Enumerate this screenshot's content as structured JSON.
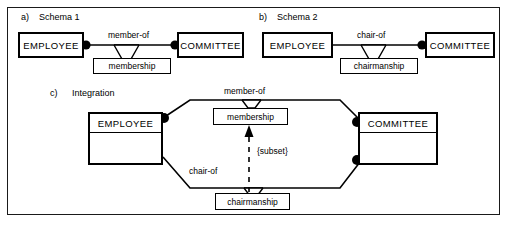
{
  "figure": {
    "border_color": "#1a1a1a",
    "background": "#ffffff",
    "ink_color": "#000000"
  },
  "parts": {
    "a": {
      "tag": "a)",
      "title": "Schema 1",
      "entity_left": "EMPLOYEE",
      "entity_right": "COMMITTEE",
      "relationship_label": "member-of",
      "relationship_box": "membership",
      "left_dot": true,
      "right_dot": true
    },
    "b": {
      "tag": "b)",
      "title": "Schema 2",
      "entity_left": "EMPLOYEE",
      "entity_right": "COMMITTEE",
      "relationship_label": "chair-of",
      "relationship_box": "chairmanship",
      "left_dot": false,
      "right_dot": true
    },
    "c": {
      "tag": "c)",
      "title": "Integration",
      "entity_left": "EMPLOYEE",
      "entity_right": "COMMITTEE",
      "relationship_label_top": "member-of",
      "relationship_box_top": "membership",
      "relationship_label_bottom": "chair-of",
      "relationship_box_bottom": "chairmanship",
      "constraint_label": "{subset}",
      "left_dot": true,
      "right_dot_top": true,
      "right_dot_bottom": true
    }
  }
}
